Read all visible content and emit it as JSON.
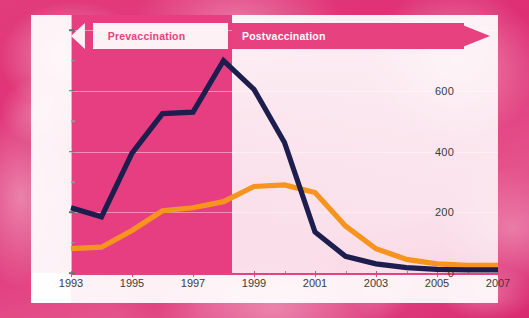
{
  "chart_data": {
    "type": "line",
    "title": "",
    "xlabel": "",
    "ylabel": "",
    "x": [
      1993,
      1994,
      1995,
      1996,
      1997,
      1998,
      1999,
      2000,
      2001,
      2002,
      2003,
      2004,
      2005,
      2006,
      2007
    ],
    "xlim": [
      1993,
      2007
    ],
    "ylim": [
      0,
      850
    ],
    "yticks": [
      0,
      200,
      400,
      600,
      800
    ],
    "yticks_minor": [
      100,
      300,
      500,
      700
    ],
    "xticks_labeled": [
      1993,
      1995,
      1997,
      1999,
      2001,
      2003,
      2005,
      2007
    ],
    "xticks_minor": [
      1994,
      1996,
      1998,
      2000,
      2002,
      2004,
      2006
    ],
    "grid": true,
    "legend_position": "none",
    "series": [
      {
        "name": "navy-series",
        "color": "#1d1d4e",
        "values": [
          215,
          185,
          395,
          525,
          530,
          700,
          605,
          430,
          135,
          55,
          30,
          18,
          12,
          10,
          10
        ]
      },
      {
        "name": "orange-series",
        "color": "#f7941e",
        "values": [
          80,
          85,
          140,
          205,
          215,
          235,
          285,
          290,
          265,
          155,
          80,
          45,
          30,
          25,
          25
        ]
      }
    ],
    "annotations": [
      {
        "name": "prevaccination",
        "label": "Prevaccination",
        "direction": "left",
        "span": [
          1993,
          1998.5
        ]
      },
      {
        "name": "postvaccination",
        "label": "Postvaccination",
        "direction": "right",
        "span": [
          1998.5,
          2007
        ]
      }
    ],
    "ytick_labels": [
      "0",
      "200",
      "400",
      "600",
      "800"
    ],
    "xtick_labels": [
      "1993",
      "1995",
      "1997",
      "1999",
      "2001",
      "2003",
      "2005",
      "2007"
    ]
  },
  "colors": {
    "navy": "#1d1d4e",
    "orange": "#f7941e",
    "pink": "#e8417f",
    "band_pre": "#e73e82",
    "band_post": "#fdf0f5"
  },
  "banners": {
    "pre_label": "Prevaccination",
    "post_label": "Postvaccination"
  }
}
